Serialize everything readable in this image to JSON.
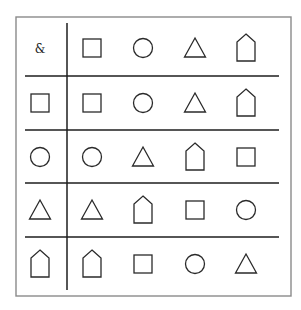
{
  "diagram": {
    "header_symbol": "&",
    "colors": {
      "frame": "#8a8a8a",
      "grid": "#1e1e1e",
      "shape_stroke": "#2a2a2a",
      "background": "#ffffff"
    },
    "column_headers": [
      "square",
      "circle",
      "triangle",
      "house"
    ],
    "rows": [
      {
        "row_header": "square",
        "cells": [
          "square",
          "circle",
          "triangle",
          "house"
        ]
      },
      {
        "row_header": "circle",
        "cells": [
          "circle",
          "triangle",
          "house",
          "square"
        ]
      },
      {
        "row_header": "triangle",
        "cells": [
          "triangle",
          "house",
          "square",
          "circle"
        ]
      },
      {
        "row_header": "house",
        "cells": [
          "house",
          "square",
          "circle",
          "triangle"
        ]
      }
    ]
  }
}
